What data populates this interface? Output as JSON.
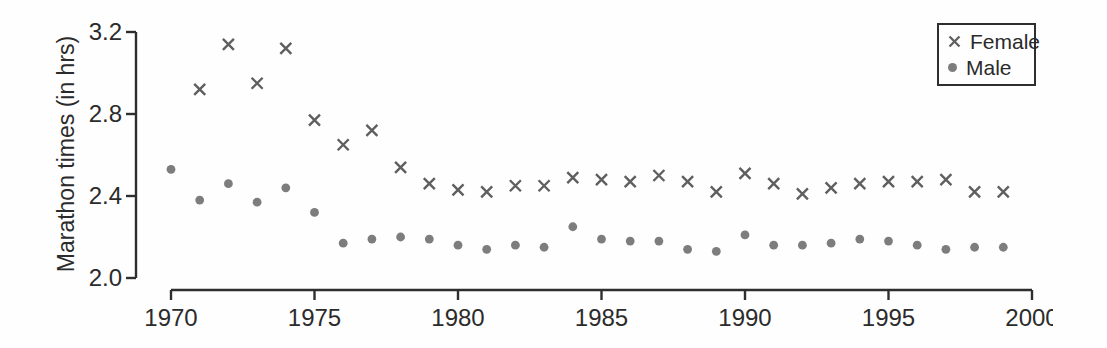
{
  "figure": {
    "background": "#fefefe",
    "axis_color": "#2e2e2e",
    "text_color": "#2b2b2b"
  },
  "chart_data": {
    "type": "scatter",
    "title": "",
    "xlabel": "",
    "ylabel": "Marathon times (in hrs)",
    "xlim": [
      1970,
      2000
    ],
    "ylim": [
      2.0,
      3.2
    ],
    "xticks": [
      1970,
      1975,
      1980,
      1985,
      1990,
      1995,
      2000
    ],
    "yticks": [
      2.0,
      2.4,
      2.8,
      3.2
    ],
    "grid": false,
    "legend_position": "top-right",
    "series": [
      {
        "name": "Female",
        "marker": "x",
        "color": "#5f5f5f",
        "points": [
          [
            1971,
            2.92
          ],
          [
            1972,
            3.14
          ],
          [
            1973,
            2.95
          ],
          [
            1974,
            3.12
          ],
          [
            1975,
            2.77
          ],
          [
            1976,
            2.65
          ],
          [
            1977,
            2.72
          ],
          [
            1978,
            2.54
          ],
          [
            1979,
            2.46
          ],
          [
            1980,
            2.43
          ],
          [
            1981,
            2.42
          ],
          [
            1982,
            2.45
          ],
          [
            1983,
            2.45
          ],
          [
            1984,
            2.49
          ],
          [
            1985,
            2.48
          ],
          [
            1986,
            2.47
          ],
          [
            1987,
            2.5
          ],
          [
            1988,
            2.47
          ],
          [
            1989,
            2.42
          ],
          [
            1990,
            2.51
          ],
          [
            1991,
            2.46
          ],
          [
            1992,
            2.41
          ],
          [
            1993,
            2.44
          ],
          [
            1994,
            2.46
          ],
          [
            1995,
            2.47
          ],
          [
            1996,
            2.47
          ],
          [
            1997,
            2.48
          ],
          [
            1998,
            2.42
          ],
          [
            1999,
            2.42
          ]
        ]
      },
      {
        "name": "Male",
        "marker": "dot",
        "color": "#7d7d7d",
        "points": [
          [
            1970,
            2.53
          ],
          [
            1971,
            2.38
          ],
          [
            1972,
            2.46
          ],
          [
            1973,
            2.37
          ],
          [
            1974,
            2.44
          ],
          [
            1975,
            2.32
          ],
          [
            1976,
            2.17
          ],
          [
            1977,
            2.19
          ],
          [
            1978,
            2.2
          ],
          [
            1979,
            2.19
          ],
          [
            1980,
            2.16
          ],
          [
            1981,
            2.14
          ],
          [
            1982,
            2.16
          ],
          [
            1983,
            2.15
          ],
          [
            1984,
            2.25
          ],
          [
            1985,
            2.19
          ],
          [
            1986,
            2.18
          ],
          [
            1987,
            2.18
          ],
          [
            1988,
            2.14
          ],
          [
            1989,
            2.13
          ],
          [
            1990,
            2.21
          ],
          [
            1991,
            2.16
          ],
          [
            1992,
            2.16
          ],
          [
            1993,
            2.17
          ],
          [
            1994,
            2.19
          ],
          [
            1995,
            2.18
          ],
          [
            1996,
            2.16
          ],
          [
            1997,
            2.14
          ],
          [
            1998,
            2.15
          ],
          [
            1999,
            2.15
          ]
        ]
      }
    ]
  }
}
